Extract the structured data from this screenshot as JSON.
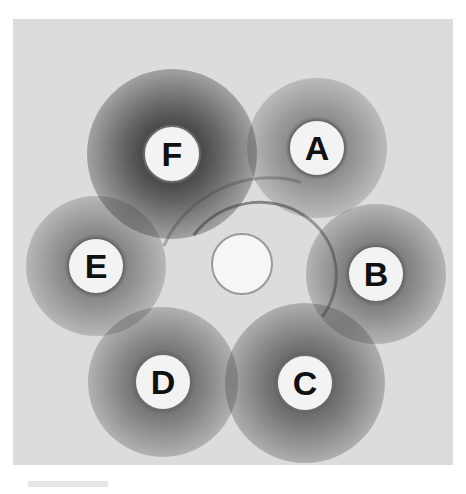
{
  "image": {
    "subject": "agar plate immunodiffusion with labeled wells and diffusion zones",
    "background_color": "#dcdcdc",
    "halo_color": "#1e1e1e"
  },
  "wells": [
    {
      "label": "F",
      "cx": 172,
      "cy": 154,
      "r": 29,
      "halo_intensity": 0.95,
      "halo_r": 85
    },
    {
      "label": "A",
      "cx": 317,
      "cy": 148,
      "r": 29,
      "halo_intensity": 0.55,
      "halo_r": 70
    },
    {
      "label": "E",
      "cx": 96,
      "cy": 266,
      "r": 29,
      "halo_intensity": 0.6,
      "halo_r": 70
    },
    {
      "label": "B",
      "cx": 376,
      "cy": 274,
      "r": 29,
      "halo_intensity": 0.65,
      "halo_r": 70
    },
    {
      "label": "D",
      "cx": 163,
      "cy": 382,
      "r": 29,
      "halo_intensity": 0.7,
      "halo_r": 75
    },
    {
      "label": "C",
      "cx": 305,
      "cy": 383,
      "r": 29,
      "halo_intensity": 0.75,
      "halo_r": 80
    }
  ],
  "center_well": {
    "cx": 242,
    "cy": 264,
    "r": 31
  }
}
